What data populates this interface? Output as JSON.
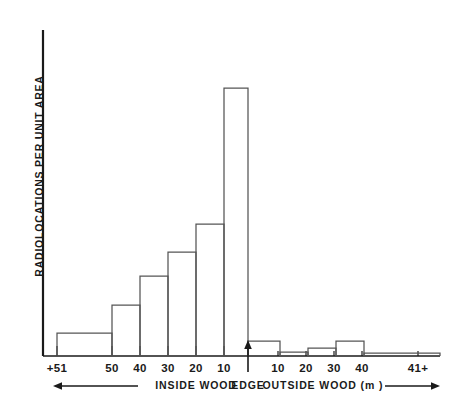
{
  "chart_data": {
    "type": "bar",
    "title": "",
    "subtitle": "",
    "xlabel": "INSIDE WOOD / EDGE / OUTSIDE WOOD (m )",
    "ylabel": "RADIOLOCATIONS PER UNIT AREA",
    "grid": false,
    "legend": "none",
    "axis": {
      "y_ticks": [],
      "y_tick_labels": [],
      "ylim": [
        0,
        100
      ],
      "x_tick_labels": [
        "+51",
        "50",
        "40",
        "30",
        "20",
        "10",
        "",
        "10",
        "20",
        "30",
        "40",
        "41+"
      ],
      "x_tick_positions_px": [
        57,
        112,
        140,
        168,
        196,
        224,
        248,
        278,
        306,
        334,
        362,
        418
      ]
    },
    "categories": [
      "+51",
      "50-41",
      "40-31",
      "30-21",
      "20-11",
      "10-1",
      "1-10",
      "11-20",
      "21-30",
      "31-40",
      "41+"
    ],
    "category_side": [
      "inside",
      "inside",
      "inside",
      "inside",
      "inside",
      "inside",
      "outside",
      "outside",
      "outside",
      "outside",
      "outside"
    ],
    "values": [
      8.6,
      19.0,
      29.9,
      38.8,
      49.3,
      100.0,
      5.6,
      1.5,
      3.0,
      5.6,
      1.1
    ],
    "values_note": "relative radiolocations per unit area, tallest bar normalised to 100",
    "bars_px": [
      {
        "label": "+51",
        "x0": 57,
        "x1": 112,
        "top": 333
      },
      {
        "label": "50-41",
        "x0": 112,
        "x1": 140,
        "top": 305
      },
      {
        "label": "40-31",
        "x0": 140,
        "x1": 168,
        "top": 276
      },
      {
        "label": "30-21",
        "x0": 168,
        "x1": 196,
        "top": 252
      },
      {
        "label": "20-11",
        "x0": 196,
        "x1": 224,
        "top": 224
      },
      {
        "label": "10-1",
        "x0": 224,
        "x1": 248,
        "top": 88
      },
      {
        "label": "1-10",
        "x0": 248,
        "x1": 280,
        "top": 341
      },
      {
        "label": "11-20",
        "x0": 280,
        "x1": 308,
        "top": 352
      },
      {
        "label": "21-30",
        "x0": 308,
        "x1": 336,
        "top": 348
      },
      {
        "label": "31-40",
        "x0": 336,
        "x1": 364,
        "top": 341
      },
      {
        "label": "41+",
        "x0": 364,
        "x1": 440,
        "top": 353
      }
    ],
    "annotations": [
      {
        "name": "edge-arrow",
        "text": "",
        "x": 248,
        "y": 356
      },
      {
        "name": "inside-arrow",
        "text": "",
        "x0": 55,
        "x1": 138,
        "direction": "left"
      },
      {
        "name": "outside-arrow",
        "text": "",
        "x0": 388,
        "x1": 440,
        "direction": "right"
      }
    ]
  },
  "axis_labels": {
    "y": "RADIOLOCATIONS PER UNIT AREA",
    "ticks": [
      {
        "text": "+51",
        "x": 57
      },
      {
        "text": "50",
        "x": 112
      },
      {
        "text": "40",
        "x": 140
      },
      {
        "text": "30",
        "x": 168
      },
      {
        "text": "20",
        "x": 196
      },
      {
        "text": "10",
        "x": 224
      },
      {
        "text": "10",
        "x": 278
      },
      {
        "text": "20",
        "x": 306
      },
      {
        "text": "30",
        "x": 334
      },
      {
        "text": "40",
        "x": 362
      },
      {
        "text": "41+",
        "x": 418
      }
    ],
    "captions": [
      {
        "text": "INSIDE WOOD",
        "x": 196
      },
      {
        "text": "EDGE",
        "x": 248
      },
      {
        "text": "OUTSIDE WOOD (m )",
        "x": 323
      }
    ]
  },
  "colors": {
    "ink": "#1a1a1a",
    "bar_stroke": "#555555",
    "background": "#ffffff"
  }
}
